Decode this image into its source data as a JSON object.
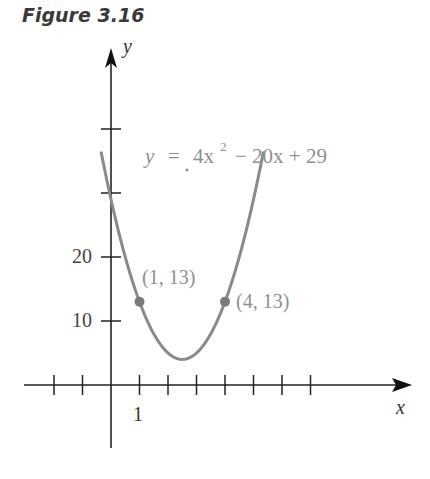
{
  "figure": {
    "title": "Figure 3.16"
  },
  "chart_data": {
    "type": "line",
    "title": "Figure 3.16",
    "equation": "y = 4x² − 20x + 29",
    "equation_parts": {
      "lhs": "y",
      "eq": "=",
      "coef": "4x",
      "exp": "2",
      "rest": "− 20x + 29"
    },
    "xlabel": "x",
    "ylabel": "y",
    "x_tick_labels": [
      "1"
    ],
    "y_tick_labels": [
      "10",
      "20"
    ],
    "xlim": [
      -3,
      10.5
    ],
    "ylim": [
      -8,
      47
    ],
    "x_ticks": [
      -2,
      -1,
      1,
      2,
      3,
      4,
      5,
      6,
      7
    ],
    "y_ticks": [
      10,
      20,
      30,
      40
    ],
    "series": [
      {
        "name": "y = 4x^2 - 20x + 29",
        "function": "4x^2 - 20x + 29",
        "x_range": [
          -0.35,
          5.35
        ],
        "color": "#8a8a8a"
      }
    ],
    "points": [
      {
        "x": 1,
        "y": 13,
        "label": "(1, 13)"
      },
      {
        "x": 4,
        "y": 13,
        "label": "(4, 13)"
      }
    ],
    "vertex": {
      "x": 2.5,
      "y": 4
    },
    "grid": false,
    "legend": "none"
  }
}
